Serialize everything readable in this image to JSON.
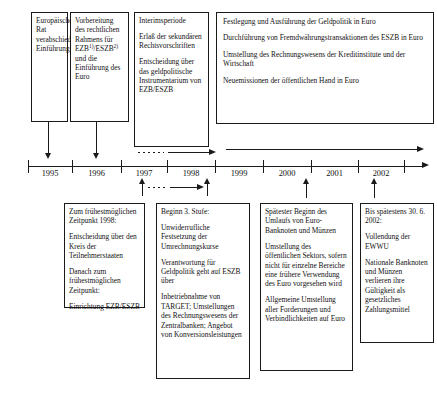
{
  "diagram": {
    "type": "timeline"
  },
  "axis": {
    "years": [
      "1995",
      "1996",
      "1997",
      "1998",
      "1999",
      "2000",
      "2001",
      "2002"
    ],
    "tick_count": 9
  },
  "top_boxes": [
    {
      "id": "b1",
      "paragraphs": [
        "Europäischer Rat verabschiedet Einführungsszenarium"
      ]
    },
    {
      "id": "b2",
      "paragraphs": [
        "Vorbereitung des rechtlichen Rahmens für EZB/ESZB und die Einführung des Euro"
      ],
      "footnote_marks": [
        "1)",
        "2)"
      ]
    },
    {
      "id": "b3",
      "paragraphs": [
        "Interimsperiode",
        "Erlaß der sekundären Rechtsvorschriften",
        "Entscheidung über das geldpolitische Instrumentarium von EZB/ESZB"
      ]
    },
    {
      "id": "b4",
      "paragraphs": [
        "Festlegung und Ausführung der Geldpolitik in Euro",
        "Durchführung von Fremdwährungstransaktionen des ESZB in Euro",
        "Umstellung des Rechnungswesens der Kreditinstitute und der Wirtschaft",
        "Neuemissionen der öffentlichen Hand in Euro"
      ]
    }
  ],
  "bottom_boxes": [
    {
      "id": "c1",
      "paragraphs": [
        "Zum frühestmöglichen Zeitpunkt 1998:",
        "Entscheidung über den Kreis der Teilnehmerstaaten",
        "Danach zum frühestmöglichen Zeitpunkt:",
        "Einrichtung EZB/ESZB"
      ]
    },
    {
      "id": "c2",
      "paragraphs": [
        "Beginn 3. Stufe:",
        "Unwiderrufliche Festsetzung der Umrechnungskurse",
        "Verantwortung für Geldpolitik geht auf ESZB über",
        "Inbetriebnahme von TARGET; Umstellungen des Rechnungswesens der Zentralbanken; Angebot von Konversionsleistungen"
      ]
    },
    {
      "id": "c3",
      "paragraphs": [
        "Spätester Beginn des Umlaufs von Euro-Banknoten und Münzen",
        "Umstellung des öffentlichen Sektors, sofern nicht für einzelne Bereiche eine frühere Verwendung des Euro vorgesehen wird",
        "Allgemeine Umstellung aller Forderungen und Verbindlichkeiten auf Euro"
      ]
    },
    {
      "id": "c4",
      "paragraphs": [
        "Bis spätestens 30. 6. 2002:",
        "Vollendung der EWWU",
        "Nationale Banknoten und Münzen verlieren ihre Gültigkeit als gesetzliches Zahlungsmittel"
      ]
    }
  ],
  "colors": {
    "ink": "#1a1a1a",
    "background": "#ffffff"
  }
}
